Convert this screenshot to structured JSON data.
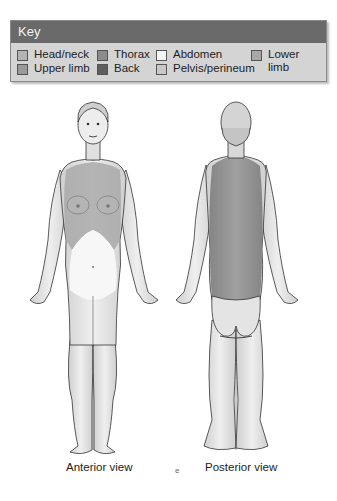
{
  "key": {
    "title": "Key",
    "items": [
      {
        "label": "Head/neck",
        "color": "#b3b3b3"
      },
      {
        "label": "Upper limb",
        "color": "#9a9a9a"
      },
      {
        "label": "Thorax",
        "color": "#8c8c8c"
      },
      {
        "label": "Back",
        "color": "#5e5e5e"
      },
      {
        "label": "Abdomen",
        "color": "#f4f4f4"
      },
      {
        "label": "Pelvis/perineum",
        "color": "#c8c8c8"
      },
      {
        "label": "Lower limb",
        "label_line1": "Lower",
        "label_line2": "limb",
        "color": "#a8a8a8"
      }
    ]
  },
  "figures": {
    "anterior": {
      "caption": "Anterior view"
    },
    "posterior": {
      "caption": "Posterior view"
    }
  },
  "colors": {
    "header_bg": "#6a6a6a",
    "key_bg": "#d4d4d4",
    "skin": "#e6e6e6",
    "thorax_region": "#a9a9a9",
    "back_region": "#8f8f8f",
    "abdomen_region": "#f7f7f7"
  },
  "stray_mark": "e"
}
